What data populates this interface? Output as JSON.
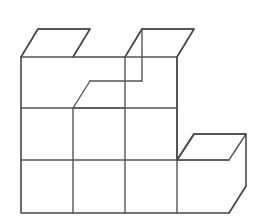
{
  "scene": {
    "title": "Isometric unit-cube block figure",
    "background_color": "#ffffff",
    "line_color": "#4a4a4a",
    "face_color": "#ffffff",
    "canvas": {
      "width": 268,
      "height": 219
    }
  },
  "projection": {
    "type": "oblique-cabinet",
    "unit_width": 52,
    "unit_height": 52,
    "depth_dx": 17,
    "depth_dy": -27,
    "origin_x": 21,
    "origin_y": 213
  },
  "structure": {
    "description": "Stack of unit cubes, 4 columns wide and 3 rows tall at the front, with a one-cube notch in the top row and a single lower step block at the right.",
    "front_grid": {
      "columns": 4,
      "rows": 3,
      "left_x": 21,
      "right_x": 229,
      "top_y": 57,
      "bottom_y": 213,
      "column_edges_x": [
        21,
        73,
        125,
        177
      ],
      "row_edges_y": [
        57,
        108,
        160,
        213
      ]
    },
    "cells": [
      {
        "col": 0,
        "row": 2,
        "filled": true
      },
      {
        "col": 1,
        "row": 2,
        "filled": true
      },
      {
        "col": 2,
        "row": 2,
        "filled": true
      },
      {
        "col": 3,
        "row": 2,
        "filled": true
      },
      {
        "col": 0,
        "row": 1,
        "filled": true
      },
      {
        "col": 1,
        "row": 1,
        "filled": true
      },
      {
        "col": 2,
        "row": 1,
        "filled": true
      },
      {
        "col": 3,
        "row": 1,
        "filled": true
      },
      {
        "col": 0,
        "row": 0,
        "filled": true
      },
      {
        "col": 1,
        "row": 0,
        "filled": false
      },
      {
        "col": 2,
        "row": 0,
        "filled": true
      },
      {
        "col": 3,
        "row": 0,
        "filled": false
      }
    ],
    "step_block": {
      "label": "lower-right step cube",
      "front_left_x": 177,
      "front_right_x": 229,
      "front_top_y": 160,
      "front_bottom_y": 213
    },
    "counts": {
      "visible_front_faces": 9,
      "visible_top_faces": 4,
      "visible_right_faces": 4
    }
  },
  "paths": {
    "outline": "M21,57 L21,213 L229,213 L246,186 L246,134 L194,134 L177,160 L177,57 L194,29 L142,29 L125,57 L73,57 L90,29 L38,29 Z",
    "top_face_left_cube": "M21,57 L38,29 L90,29 L73,57 Z",
    "top_face_notch": "M73,57 L90,29 L142,29 L125,57 Z",
    "top_face_right_cube": "M125,57 L142,29 L194,29 L177,57 Z",
    "top_face_step": "M177,160 L194,134 L246,134 L229,160 Z",
    "right_face_left_cube": "M73,57 L90,29 L90,81 L73,108 Z",
    "right_face_right_cube": "M177,57 L194,29 L194,134 L177,160 Z",
    "right_face_step": "M229,160 L246,134 L246,186 L229,213 Z",
    "interior_horizontals": [
      "M21,108 L177,108",
      "M21,160 L229,160"
    ],
    "interior_verticals": [
      "M73,108 L73,213",
      "M125,57 L125,213",
      "M177,57 L177,213"
    ],
    "notch_floor_front": "M73,108 L125,108",
    "notch_floor_diagonal": "M73,108 L90,81",
    "notch_floor_back": "M90,81 L142,81",
    "notch_back_vertical": "M142,81 L142,29",
    "step_top_diagonal": "M177,160 L194,134",
    "bottom_right_diagonal": "M229,213 L246,186"
  }
}
